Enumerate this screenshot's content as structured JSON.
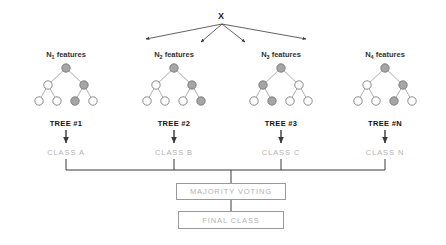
{
  "diagram": {
    "root_label": "X",
    "colors": {
      "node_fill_selected": "#a6a6a6",
      "node_fill_plain": "#ffffff",
      "node_stroke": "#6e6e6e",
      "edge": "#8c8c8c",
      "arrow": "#3a3a3a",
      "bus_line": "#3a3a3a",
      "text_dark": "#111111",
      "text_gray": "#b3b3b3",
      "box_border": "#9a9a9a"
    },
    "trees": [
      {
        "features_label_prefix": "N",
        "features_label_sub": "1",
        "features_label_suffix": " features",
        "tree_label": "TREE #1",
        "class_label": "CLASS A",
        "center_x": 66,
        "nodes": {
          "root": "gray",
          "level2": [
            "white",
            "gray"
          ],
          "leaves": [
            "white",
            "white",
            "gray",
            "white"
          ]
        }
      },
      {
        "features_label_prefix": "N",
        "features_label_sub": "2",
        "features_label_suffix": " features",
        "tree_label": "TREE #2",
        "class_label": "CLASS B",
        "center_x": 174,
        "nodes": {
          "root": "gray",
          "level2": [
            "white",
            "gray"
          ],
          "leaves": [
            "white",
            "white",
            "white",
            "gray"
          ]
        }
      },
      {
        "features_label_prefix": "N",
        "features_label_sub": "3",
        "features_label_suffix": " features",
        "tree_label": "TREE #3",
        "class_label": "CLASS C",
        "center_x": 281,
        "nodes": {
          "root": "gray",
          "level2": [
            "gray",
            "white"
          ],
          "leaves": [
            "white",
            "gray",
            "white",
            "white"
          ]
        }
      },
      {
        "features_label_prefix": "N",
        "features_label_sub": "4",
        "features_label_suffix": " features",
        "tree_label": "TREE #N",
        "class_label": "CLASS N",
        "center_x": 385,
        "nodes": {
          "root": "gray",
          "level2": [
            "white",
            "gray"
          ],
          "leaves": [
            "white",
            "white",
            "gray",
            "white"
          ]
        }
      }
    ],
    "aggregation": {
      "majority_voting_label": "MAJORITY VOTING",
      "final_class_label": "FINAL CLASS"
    }
  }
}
